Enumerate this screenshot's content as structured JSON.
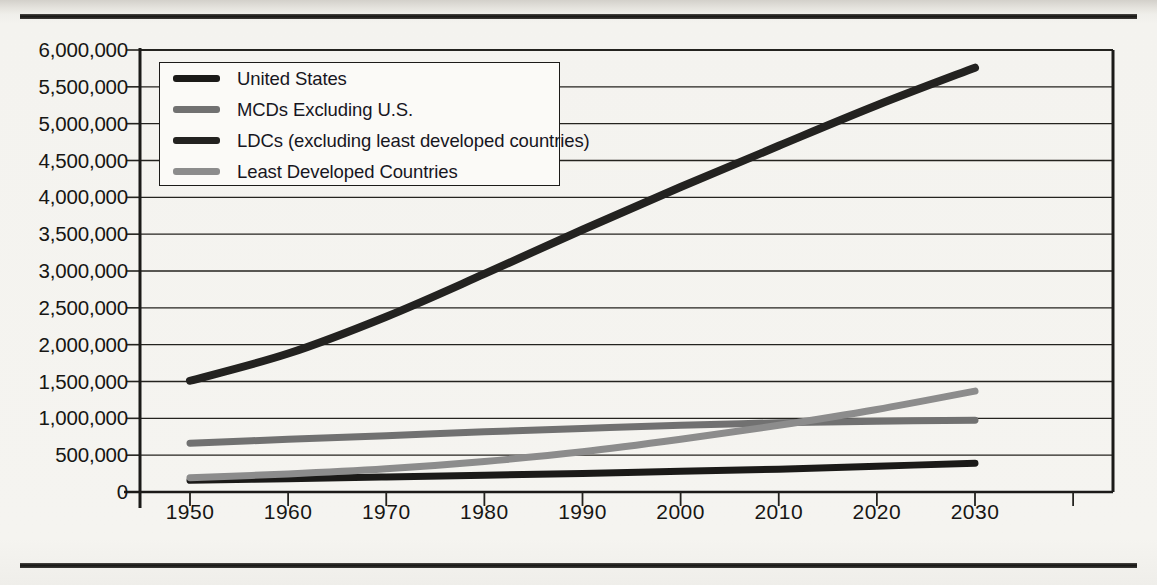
{
  "chart_data": {
    "type": "line",
    "title": "",
    "xlabel": "",
    "ylabel": "",
    "xlim": [
      1950,
      2030
    ],
    "ylim": [
      0,
      6000000
    ],
    "grid": true,
    "legend_position": "top-left",
    "x": [
      1950,
      1960,
      1970,
      1980,
      1990,
      2000,
      2010,
      2020,
      2030
    ],
    "y_ticks": [
      0,
      500000,
      1000000,
      1500000,
      2000000,
      2500000,
      3000000,
      3500000,
      4000000,
      4500000,
      5000000,
      5500000,
      6000000
    ],
    "y_tick_labels": [
      "0",
      "500,000",
      "1,000,000",
      "1,500,000",
      "2,000,000",
      "2,500,000",
      "3,000,000",
      "3,500,000",
      "4,000,000",
      "4,500,000",
      "5,000,000",
      "5,500,000",
      "6,000,000"
    ],
    "x_tick_labels": [
      "1950",
      "1960",
      "1970",
      "1980",
      "1990",
      "2000",
      "2010",
      "2020",
      "2030"
    ],
    "series": [
      {
        "name": "United States",
        "color": "#1b1a18",
        "width": 7,
        "values": [
          158000,
          181000,
          205000,
          228000,
          250000,
          282000,
          310000,
          350000,
          390000
        ]
      },
      {
        "name": "MCDs Excluding U.S.",
        "color": "#717171",
        "width": 7,
        "values": [
          662000,
          715000,
          765000,
          818000,
          862000,
          905000,
          940000,
          962000,
          975000
        ]
      },
      {
        "name": "LDCs (excluding least developed countries)",
        "color": "#232220",
        "width": 8,
        "values": [
          1510000,
          1880000,
          2380000,
          2960000,
          3560000,
          4140000,
          4700000,
          5250000,
          5760000
        ]
      },
      {
        "name": "Least Developed Countries",
        "color": "#8c8c8c",
        "width": 7,
        "values": [
          195000,
          245000,
          315000,
          415000,
          545000,
          715000,
          905000,
          1120000,
          1370000
        ]
      }
    ]
  },
  "legend": {
    "items": [
      {
        "label": "United States",
        "color": "#1b1a18"
      },
      {
        "label": "MCDs Excluding U.S.",
        "color": "#717171"
      },
      {
        "label": "LDCs (excluding least developed countries)",
        "color": "#232220"
      },
      {
        "label": "Least Developed Countries",
        "color": "#8c8c8c"
      }
    ]
  }
}
